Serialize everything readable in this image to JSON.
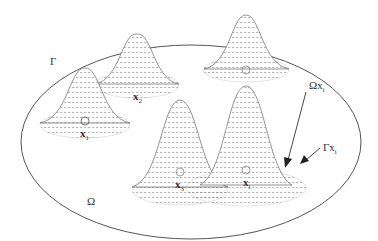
{
  "diagram": {
    "type": "domain-with-gaussian-kernels",
    "labels": {
      "boundary": "Γ",
      "domain": "Ω",
      "subdomain": "Ωx",
      "subdomain_sub": "i",
      "sub_boundary": "Γx",
      "sub_boundary_sub": "i"
    },
    "peaks": [
      {
        "id": "x1",
        "label": "x",
        "sub": "1",
        "cx": 85,
        "base_y": 125,
        "top_y": 68,
        "width": 90
      },
      {
        "id": "x2",
        "label": "x",
        "sub": "2",
        "cx": 137,
        "base_y": 85,
        "top_y": 34,
        "width": 80
      },
      {
        "id": "x3",
        "label": "x",
        "sub": "3",
        "cx": 180,
        "base_y": 195,
        "top_y": 100,
        "width": 90
      },
      {
        "id": "xi",
        "label": "x",
        "sub": "i",
        "cx": 246,
        "base_y": 198,
        "top_y": 86,
        "width": 110
      },
      {
        "id": "x_top",
        "label": "",
        "sub": "",
        "cx": 246,
        "base_y": 70,
        "top_y": 15,
        "width": 85
      }
    ],
    "colors": {
      "outline": "#555555",
      "mesh": "#9a9a9a",
      "arrow": "#222222"
    }
  }
}
